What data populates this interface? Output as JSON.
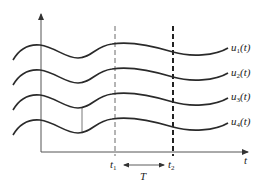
{
  "diagram": {
    "type": "waveform-ensemble",
    "axes": {
      "x_label": "t",
      "y_label": ""
    },
    "curves": [
      {
        "label_main": "u",
        "label_sub": "1",
        "label_tail": "(t)",
        "offset": 0
      },
      {
        "label_main": "u",
        "label_sub": "2",
        "label_tail": "(t)",
        "offset": 25
      },
      {
        "label_main": "u",
        "label_sub": "3",
        "label_tail": "(t)",
        "offset": 50
      },
      {
        "label_main": "u",
        "label_sub": "4",
        "label_tail": "(t)",
        "offset": 75
      }
    ],
    "markers": {
      "t1": {
        "main": "t",
        "sub": "1"
      },
      "t2": {
        "main": "t",
        "sub": "2"
      },
      "interval": "T"
    },
    "colors": {
      "stroke": "#2a2a2a",
      "axis": "#555555",
      "text": "#222222"
    }
  }
}
